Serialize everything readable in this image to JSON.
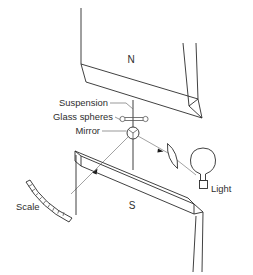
{
  "figure": {
    "background_color": "#ffffff",
    "line_color": "#2b2b2b",
    "beam_color": "#8a8a8a",
    "label_color": "#2e2e2e"
  },
  "labels": {
    "north_pole": "N",
    "south_pole": "S",
    "suspension": "Suspension",
    "glass_spheres": "Glass spheres",
    "mirror": "Mirror",
    "scale": "Scale",
    "light": "Light"
  },
  "parts": {
    "north_magnet": "north-magnet-bar",
    "south_magnet": "south-magnet-bar",
    "suspension_fibre": "suspension-fibre",
    "sphere_left": "glass-sphere-left",
    "sphere_right": "glass-sphere-right",
    "sphere_bar": "glass-sphere-bar",
    "mirror_disc": "mirror-disc",
    "lens": "converging-lens",
    "lamp": "light-bulb",
    "scale_arc": "curved-scale",
    "incident_ray": "incident-light-ray",
    "reflected_ray": "reflected-light-ray",
    "support_left": "support-column-left",
    "support_right": "support-column-right"
  }
}
